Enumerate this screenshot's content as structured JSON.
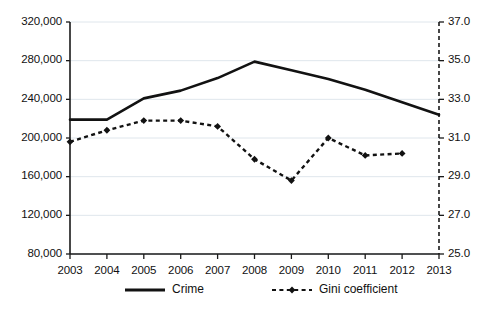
{
  "chart_data": {
    "type": "line",
    "title": "",
    "xlabel": "",
    "ylabel": "",
    "grid": true,
    "legend_position": "bottom",
    "categories": [
      "2003",
      "2004",
      "2005",
      "2006",
      "2007",
      "2008",
      "2009",
      "2010",
      "2011",
      "2012",
      "2013"
    ],
    "axes": {
      "x": {
        "tick_labels": [
          "2003",
          "2004",
          "2005",
          "2006",
          "2007",
          "2008",
          "2009",
          "2010",
          "2011",
          "2012",
          "2013"
        ]
      },
      "y_left": {
        "label": "",
        "ylim": [
          80000,
          320000
        ],
        "tick_labels": [
          "320,000",
          "280,000",
          "240,000",
          "200,000",
          "160,000",
          "120,000",
          "80,000"
        ],
        "tick_values": [
          320000,
          280000,
          240000,
          200000,
          160000,
          120000,
          80000
        ]
      },
      "y_right": {
        "label": "",
        "ylim": [
          25.0,
          37.0
        ],
        "tick_labels": [
          "37.0",
          "35.0",
          "33.0",
          "31.0",
          "29.0",
          "27.0",
          "25.0"
        ],
        "tick_values": [
          37.0,
          35.0,
          33.0,
          31.0,
          29.0,
          27.0,
          25.0
        ]
      }
    },
    "series": [
      {
        "name": "Crime",
        "axis": "left",
        "style": "solid",
        "marker": "none",
        "x": [
          "2003",
          "2004",
          "2005",
          "2006",
          "2007",
          "2008",
          "2009",
          "2010",
          "2011",
          "2012",
          "2013"
        ],
        "values": [
          219000,
          219000,
          241000,
          249000,
          262000,
          279000,
          270000,
          261000,
          250000,
          237000,
          224000
        ]
      },
      {
        "name": "Gini coefficient",
        "axis": "right",
        "style": "dashed",
        "marker": "diamond",
        "x": [
          "2003",
          "2004",
          "2005",
          "2006",
          "2007",
          "2008",
          "2009",
          "2010",
          "2011",
          "2012"
        ],
        "values": [
          30.8,
          31.4,
          31.9,
          31.9,
          31.6,
          29.9,
          28.8,
          31.0,
          30.1,
          30.2
        ]
      }
    ],
    "legend": [
      {
        "label": "Crime",
        "style": "solid",
        "marker": "none"
      },
      {
        "label": "Gini coefficient",
        "style": "dashed",
        "marker": "diamond"
      }
    ],
    "colors": {
      "series": "#121212",
      "gridline": "#dfe6ec",
      "axis": "#1a1a1a",
      "background": "#ffffff"
    }
  }
}
